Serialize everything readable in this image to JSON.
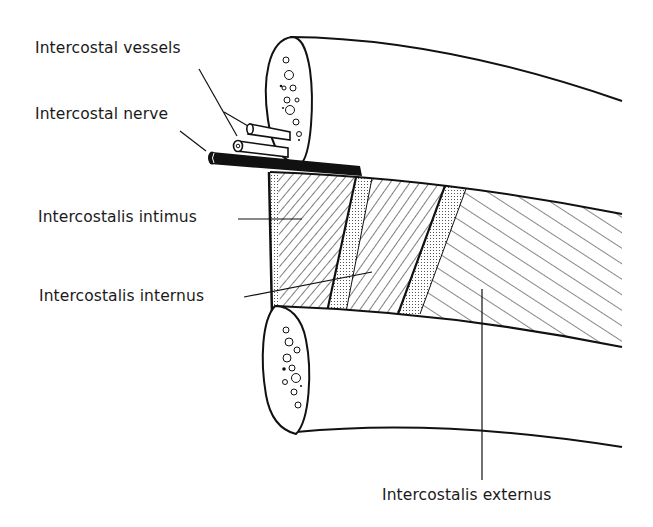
{
  "diagram": {
    "labels": {
      "vessels": "Intercostal vessels",
      "nerve": "Intercostal nerve",
      "intimus": "Intercostalis intimus",
      "internus": "Intercostalis internus",
      "externus": "Intercostalis externus"
    },
    "colors": {
      "ink": "#111111",
      "paper": "#ffffff"
    }
  }
}
